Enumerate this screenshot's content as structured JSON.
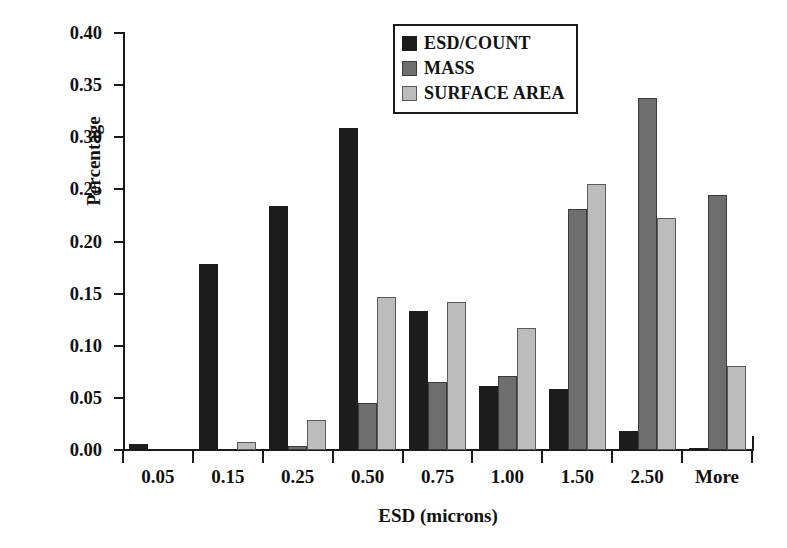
{
  "chart_data": {
    "type": "bar",
    "title": "",
    "xlabel": "ESD (microns)",
    "ylabel": "Percentage",
    "categories": [
      "0.05",
      "0.15",
      "0.25",
      "0.50",
      "0.75",
      "1.00",
      "1.50",
      "2.50",
      "More"
    ],
    "series": [
      {
        "name": "ESD/COUNT",
        "color": "#1c1c1c",
        "values": [
          0.006,
          0.178,
          0.234,
          0.309,
          0.133,
          0.061,
          0.059,
          0.018,
          0.002
        ]
      },
      {
        "name": "MASS",
        "color": "#6e6e6e",
        "values": [
          0.0,
          0.0,
          0.004,
          0.045,
          0.065,
          0.071,
          0.231,
          0.338,
          0.245
        ]
      },
      {
        "name": "SURFACE AREA",
        "color": "#bcbcbc",
        "values": [
          0.0,
          0.008,
          0.029,
          0.147,
          0.142,
          0.117,
          0.255,
          0.223,
          0.081
        ]
      }
    ],
    "ylim": [
      0.0,
      0.4
    ],
    "ytick_labels": [
      "0.00",
      "0.05",
      "0.10",
      "0.15",
      "0.20",
      "0.25",
      "0.30",
      "0.35",
      "0.40"
    ],
    "ytick_values": [
      0.0,
      0.05,
      0.1,
      0.15,
      0.2,
      0.25,
      0.3,
      0.35,
      0.4
    ],
    "grid": false,
    "legend_position": "top-center",
    "legend_entries": [
      "ESD/COUNT",
      "MASS",
      "SURFACE AREA"
    ]
  }
}
